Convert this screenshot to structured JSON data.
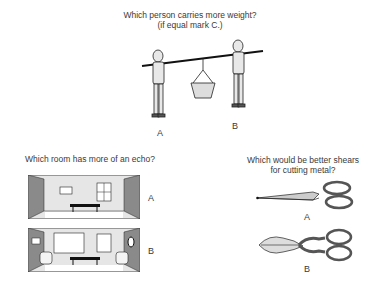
{
  "questions": [
    {
      "id": "weight",
      "prompt_line1": "Which person carries more weight?",
      "prompt_line2": "(if equal mark C.)",
      "options": [
        "A",
        "B"
      ]
    },
    {
      "id": "echo",
      "prompt_line1": "Which room has more of an echo?",
      "options": [
        "A",
        "B"
      ]
    },
    {
      "id": "shears",
      "prompt_line1": "Which would be better shears",
      "prompt_line2": "for cutting metal?",
      "options": [
        "A",
        "B"
      ]
    }
  ]
}
